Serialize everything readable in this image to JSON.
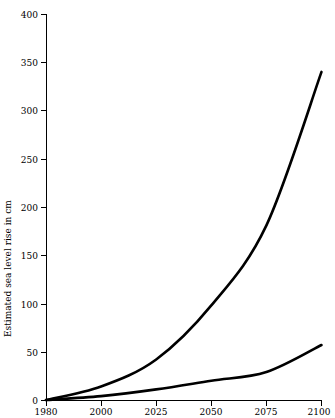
{
  "chart_data": {
    "type": "line",
    "title": "",
    "subtitle": "",
    "xlabel": "",
    "ylabel": "Estimated sea level rise in cm",
    "x": [
      1980,
      2000,
      2025,
      2050,
      2075,
      2100
    ],
    "xtick_labels": [
      "1980",
      "2000",
      "2025",
      "2050",
      "2075",
      "2100"
    ],
    "ytick_labels": [
      "0",
      "50",
      "100",
      "150",
      "200",
      "250",
      "300",
      "350",
      "400"
    ],
    "ytick_values": [
      0,
      50,
      100,
      150,
      200,
      250,
      300,
      350,
      400
    ],
    "ylim": [
      0,
      400
    ],
    "xlim_labels": [
      "1980",
      "2100"
    ],
    "grid": false,
    "legend": false,
    "legend_position": "none",
    "line_color": "#000000",
    "background_color": "#ffffff",
    "series": [
      {
        "name": "high-scenario",
        "values": [
          0,
          14,
          42,
          98,
          181,
          340
        ],
        "color": "#000000"
      },
      {
        "name": "low-scenario",
        "values": [
          0,
          4,
          11,
          20,
          29,
          57
        ],
        "color": "#000000"
      }
    ],
    "annotations": []
  },
  "axes": {
    "y_axis_label": "Estimated sea level rise in cm",
    "x_axis_label": ""
  }
}
